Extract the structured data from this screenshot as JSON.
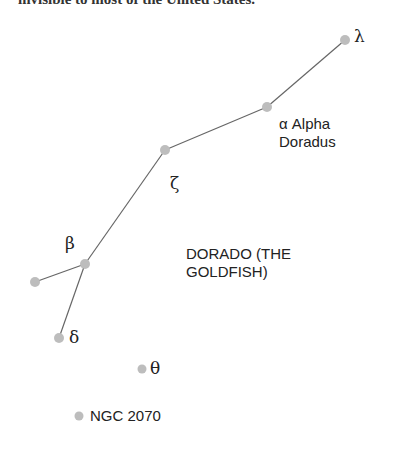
{
  "caption": "invisible to most of the United States.",
  "constellation": {
    "name_line1": "DORADO (THE",
    "name_line2": "GOLDFISH)"
  },
  "stars": [
    {
      "id": "lambda",
      "label": "λ",
      "x": 345,
      "y": 40
    },
    {
      "id": "alpha",
      "label": "α Alpha",
      "label2": "Doradus",
      "x": 267,
      "y": 107
    },
    {
      "id": "zeta",
      "label": "ζ",
      "x": 165,
      "y": 150
    },
    {
      "id": "beta",
      "label": "β",
      "x": 85,
      "y": 264
    },
    {
      "id": "unnamed",
      "label": "",
      "x": 35,
      "y": 282
    },
    {
      "id": "delta",
      "label": "δ",
      "x": 59,
      "y": 338
    },
    {
      "id": "theta",
      "label": "θ",
      "x": 142,
      "y": 369
    },
    {
      "id": "ngc2070",
      "label": "NGC 2070",
      "x": 79,
      "y": 416
    }
  ],
  "colors": {
    "star": "#bdbdbd",
    "line": "#666666",
    "text": "#222222"
  }
}
